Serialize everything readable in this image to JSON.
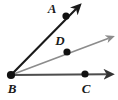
{
  "figure": {
    "type": "geometry-diagram",
    "background_color": "#ffffff",
    "width": 118,
    "height": 100
  },
  "colors": {
    "ray_black": "#1a1a1a",
    "ray_gray": "#8c8c8c",
    "ray_dark_gray": "#4d4d4d",
    "point_fill": "#111111",
    "label_color": "#1a1a1a"
  },
  "vertex": {
    "name": "B",
    "label": "B",
    "x": 11,
    "y": 75,
    "label_x": 8,
    "label_y": 92
  },
  "points": [
    {
      "name": "A",
      "label": "A",
      "x": 66,
      "y": 16,
      "label_x": 52,
      "label_y": 13,
      "dot_radius": 3.6
    },
    {
      "name": "D",
      "label": "D",
      "x": 67,
      "y": 52,
      "label_x": 58,
      "label_y": 45,
      "dot_radius": 3.6
    },
    {
      "name": "C",
      "label": "C",
      "x": 85,
      "y": 74,
      "label_x": 82,
      "label_y": 92,
      "dot_radius": 3.6
    }
  ],
  "rays": [
    {
      "name": "ray-BA",
      "label": "BA",
      "from": "B",
      "through": "A",
      "x1": 11,
      "y1": 75,
      "x2": 80,
      "y2": 5,
      "color": "#1a1a1a",
      "stroke_width": 2.1,
      "arrow": true
    },
    {
      "name": "ray-BD",
      "label": "BD",
      "from": "B",
      "through": "D",
      "x1": 11,
      "y1": 75,
      "x2": 112,
      "y2": 36,
      "color": "#8c8c8c",
      "stroke_width": 1.6,
      "arrow": true
    },
    {
      "name": "ray-BC",
      "label": "BC",
      "from": "B",
      "through": "C",
      "x1": 11,
      "y1": 75,
      "x2": 112,
      "y2": 74,
      "color": "#4d4d4d",
      "stroke_width": 2.1,
      "arrow": true
    }
  ]
}
